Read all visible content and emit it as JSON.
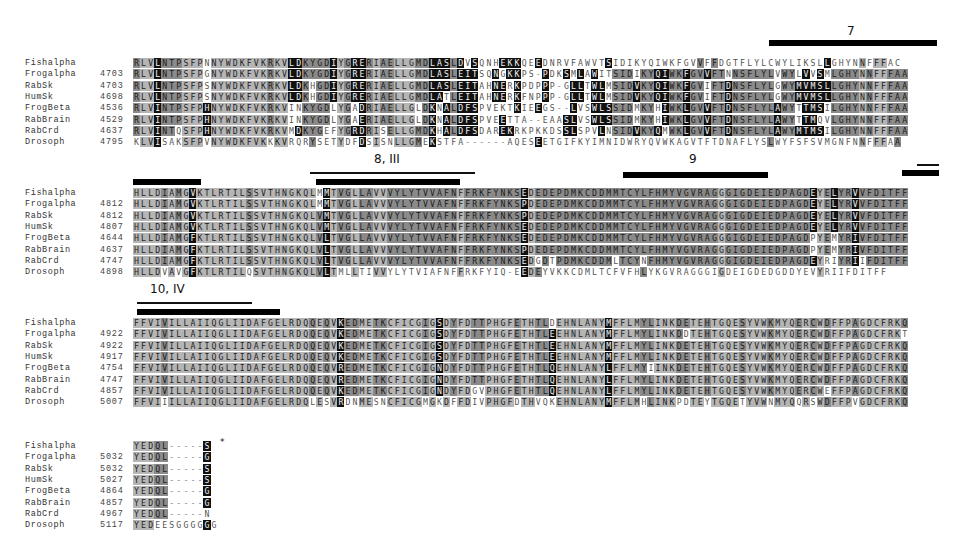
{
  "figure": {
    "type": "multiple-sequence-alignment",
    "species": [
      "Fishalpha",
      "Frogalpha",
      "RabSk",
      "HumSk",
      "FrogBeta",
      "RabBrain",
      "RabCrd",
      "Drosoph"
    ],
    "colors": {
      "identical": "#111111",
      "similar": "#8a8a8a",
      "background": "#b5b5b5",
      "none": "#ffffff"
    }
  },
  "blocks": [
    {
      "annotations": [
        {
          "label": "7",
          "bar_x": 769,
          "bar_w": 168,
          "bar_y": 40,
          "label_x": 847,
          "label_y": 24
        }
      ],
      "rows": [
        {
          "name": "Fishalpha",
          "start": "",
          "seq": "RLVLNTPSFPNNYWDKFVKRKVLDKYGDIYGRERIAELLGMDLASLDVSQNHEKKQEEDNRVFAWVTSIDIKYQIWKFGVVFFDGTFLYLCWYLIKSLLGHYNNFFFAC"
        },
        {
          "name": "Frogalpha",
          "start": "4703",
          "seq": "RLVLNTPSFPGNYWDKFVKRKVLDKYGDIYGRERIAELLGMDLASLEITSQNGKKPS-PDKSMLAWITSIDIKYQIWKFGVVFTNNSFLYLVWYLVVSMLGHYNNFFFAA"
        },
        {
          "name": "RabSk",
          "start": "4703",
          "seq": "RLVLNTPSFPSNYWDKFVKRKVLDKHGDIYGRERIAELLGMDLASLEITAHNERKPDPPP-GLLTWLMSIDVKYQIWKFGVIFTDNSFLYLGWYMVMSLLGHYNNFFFAA"
        },
        {
          "name": "HumSk",
          "start": "4698",
          "seq": "RLVLNTPSFPSNYWDKFVKRKVLDKHGDIYGRERIAELLGMDLATLEITAHNERKFNPPP-GLLTWLMSIDVKYQIWKFGVIFTDNSFLYLGWYMVMSLLGHYNNFFFAA"
        },
        {
          "name": "FrogBeta",
          "start": "4536",
          "seq": "RLVINTPSFPHNYWDKFVKRKVINKYGDLYGADRIAELLGLDKNALDFSPVEKTKIEEGS--LVSWLSSIDMKYHIWKLGVVFTDNSFLYLAWYTTMSILGHYNNFFFAA"
        },
        {
          "name": "RabBrain",
          "start": "4529",
          "seq": "RLVINTPSFPHNYWDKFVKRKVINKYGDLYGAERIAELLGLDKNALDFSPVEETTA--EAASLVSWLSSIDMKYHIWKLGVVFTDNSFLYLAWYTTMQVLGHYNNFFFAA"
        },
        {
          "name": "RabCrd",
          "start": "4637",
          "seq": "RLVINTQSFPHNYWDKFVKRKVMDKYGEFYGRDRISELLGMDKHALDFSDAREKRKPKKDSSLSPVLNSIDVKYQMWKLGVVFTDNSFLYLAWYMTMSILGHYNNFFFAA"
        },
        {
          "name": "Drosoph",
          "start": "4795",
          "seq": "KLVISAKSFPVNYWDKFVKKKVRQRYSETYDFDSISNLLGMEKSTFA------AQESEETGIFKYIMNIDWRYQVWKAGVTFTDNAFLYSLWYFSFSVMGNFNNFFFAA"
        }
      ]
    },
    {
      "annotations": [
        {
          "label": "",
          "bar_x": 133,
          "bar_w": 68,
          "bar_y": 179
        },
        {
          "label": "8, III",
          "bar_x": 316,
          "bar_w": 144,
          "bar_y": 179,
          "thin_x": 310,
          "thin_w": 165,
          "thin_y": 172,
          "label_x": 374,
          "label_y": 152
        },
        {
          "label": "9",
          "bar_x": 623,
          "bar_w": 145,
          "bar_y": 172,
          "label_x": 689,
          "label_y": 152
        },
        {
          "label": "",
          "bar_x": 902,
          "bar_w": 37,
          "bar_y": 170,
          "thin_x": 917,
          "thin_w": 22,
          "thin_y": 164
        }
      ],
      "rows": [
        {
          "name": "Fishalpha",
          "start": "",
          "seq": "HLLDIAMGVKTLRTILSSVTHNGKQLMMTVGLLAVVVYLYTVVAFNFFRKFYNKSEDEDEPDMKCDDMMTCYLFHMYVGVRAGGGIGDEIEDPAGDEYELYRVVFDITFF"
        },
        {
          "name": "Frogalpha",
          "start": "4812",
          "seq": "HLLDIAMGVKTLRTILSSVTHNGKQLMMTVGLLAVVVYLYTVVAFNFFRKFYNKSPDEDEPDMKCDDMMTCYLFHMYVGVRAGGGIGDEIEDPAGDEYELYRVVFDITFF"
        },
        {
          "name": "RabSk",
          "start": "4812",
          "seq": "HLLDIAMGVKTLRTILSSVTHNGKQLVMTVGLLAVVVYLYTVVAFNFFRKFYNKSPDEDEPDMKCDDMMTCYLFHMYVGVRAGGGIGDEIEDPAGDEYELYRVVFDITFF"
        },
        {
          "name": "HumSk",
          "start": "4807",
          "seq": "HLLDIAMGVKTLRTILSSVTHNGKQLVMTVGLLAVVVYLYTVVAFNFFRKFYNKSEDEDEPDMKCDDMMTCYLFHMYVGVRAGGGIGDEIEDPAGDEYELYRVVFDITFF"
        },
        {
          "name": "FrogBeta",
          "start": "4644",
          "seq": "HLLDIAMGFKTLRTILSSVTHNGKQLVLTVGLLAVVVYLYTVVAFNFFRKFYNKSEDEDEPDMKCDDMMTCYLFHMYVGVRAGGGIGDEIEDPAGDPYEMYRIVFDITFF"
        },
        {
          "name": "RabBrain",
          "start": "4637",
          "seq": "HLLDIAMGFKTLRTILSSVTHNGKQLVLTVGLLAVVVYLYTVVAFNFFRKFYNKSPDEDEPDMKCDDMMTCYLFHMYVGVRAGGGIGDEIEDPAGDPYEMYRIVFDITFF"
        },
        {
          "name": "RabCrd",
          "start": "4747",
          "seq": "HLLDIAMGFKTLRTILSSVTHNGKQLVLTVGLLAVVVYLYTVVAFNFFRKFYNKSEDGDTPDMKCDDMLTCYNFHMYVGVRAGGGIGDEIEDPAGDEYRIYRIIFDITFF"
        },
        {
          "name": "Drosoph",
          "start": "4898",
          "seq": "HLLDVAVGFKTLRTILQSVTHNGKQLVLTMLLTIVVYLYTVIAFNFFRKFYIQ-EEDEYVKKCDMLTCFVFHLYKGVRAGGGIGDEIGDEDGDDYEVYRIIFDITFF"
        }
      ]
    },
    {
      "annotations": [
        {
          "label": "10, IV",
          "bar_x": 137,
          "bar_w": 143,
          "bar_y": 309,
          "thin_x": 137,
          "thin_w": 115,
          "thin_y": 302,
          "label_x": 150,
          "label_y": 282
        }
      ],
      "rows": [
        {
          "name": "Fishalpha",
          "start": "",
          "seq": "FFVIVILLAIIQGLIIDAFGELRDQQEQVKEDMETKCFICGIGSDYFDTTPHGFETHTLDEHNLANYMFFLMYLINKDETEHTGQESYVWKMYQERCWDFFPAGDCFRKQ"
        },
        {
          "name": "Frogalpha",
          "start": "4922",
          "seq": "FFVIVILLAIIQGLIIDAFGELRDQQEQVKEDMETKCFICGIGSDYFDTTPHGFETHTLEEHNLANYMFFLMYLINKDDTEHTGQESYVWKMYQERCWDFFPAGDCFRKT"
        },
        {
          "name": "RabSk",
          "start": "4922",
          "seq": "FFVIVILLAIIQGLIIDAFGELRDQQEQVKEDMETKCFICGIGSDYFDTTPHGFETHTLEEHNLANYMFFLMYLINKDETEHTGQESYVWKMYQERCWDFFPAGDCFRKQ"
        },
        {
          "name": "HumSk",
          "start": "4917",
          "seq": "FFVIVILLAIIQGLIIDAFGELRDQQEQVKEDMETKCFICGIGSDYFDTTPHGFETHTLEEHNLANYMFFLMYLINKDETEHTGQESYVWKMYQERCWDFFPAGDCFRKQ"
        },
        {
          "name": "FrogBeta",
          "start": "4754",
          "seq": "FFVIVILLAIIQGLIIDAFGELRDQQEQVREDMETKCFICGIGNDYFDTTPHGFETHTLQEHNLANYLFFLMYIINKDETEHTGQESYVWKMYQERCWDFFPAGDCFRKQ"
        },
        {
          "name": "RabBrain",
          "start": "4747",
          "seq": "FFVIVILLAIIQGLIIDAFGELRDQQEQVREDMETKCFICGIGNDYFDTTPHGFETHTLQEHNLANYLFFLMYLINKDETEHTGQESYVWKMYQERCWDFFPAGDCFRKQ"
        },
        {
          "name": "RabCrd",
          "start": "4857",
          "seq": "FFVIVILLAIIQGLIIDAFGELRDQQEQVKEDMETKCFICGIGNDYFDGVPHGFETHTLQEHNLANYLFFLMYLINKDETEHTGQESYVWKMYQERCWEFFPAGDCFRKQ"
        },
        {
          "name": "Drosoph",
          "start": "5007",
          "seq": "FFVIIILLAIIQGLIIDAFGELRDQLESVRDNMESNCFICGMGKDFFDIVPHGFDTHVQKEHNLANYMFFLMHLINKPDTEYTGQETYVWNMYQQRSWDFFPVGDCFRKQ"
        }
      ]
    },
    {
      "annotations": [
        {
          "label": "*",
          "label_x": 220,
          "label_y": 437
        }
      ],
      "rows": [
        {
          "name": "Fishalpha",
          "start": "",
          "seq": "YEDQL-----S"
        },
        {
          "name": "Frogalpha",
          "start": "5032",
          "seq": "YEDQL-----G"
        },
        {
          "name": "RabSk",
          "start": "5032",
          "seq": "YEDQL-----S"
        },
        {
          "name": "HumSk",
          "start": "5027",
          "seq": "YEDQL-----S"
        },
        {
          "name": "FrogBeta",
          "start": "4864",
          "seq": "YEDQL-----G"
        },
        {
          "name": "RabBrain",
          "start": "4857",
          "seq": "YEDQL-----G"
        },
        {
          "name": "RabCrd",
          "start": "4967",
          "seq": "YEDQL-----N"
        },
        {
          "name": "Drosoph",
          "start": "5117",
          "seq": "YEDEESGGGGGG"
        }
      ]
    }
  ]
}
